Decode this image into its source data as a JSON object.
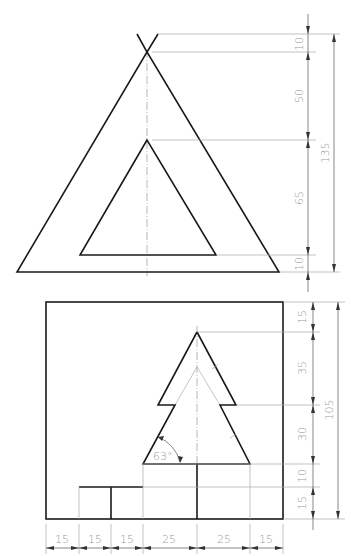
{
  "drawing": {
    "type": "technical-drawing",
    "views": [
      {
        "name": "top-view",
        "description": "Outer triangle with inner triangular cutout, apex lines crossing",
        "dimensions_vertical": [
          {
            "label": "10"
          },
          {
            "label": "50"
          },
          {
            "label": "65"
          },
          {
            "label": "10"
          },
          {
            "label": "135"
          }
        ]
      },
      {
        "name": "bottom-view",
        "description": "Square frame with fir-tree shape and stepped base",
        "dimensions_vertical": [
          {
            "label": "15"
          },
          {
            "label": "35"
          },
          {
            "label": "30"
          },
          {
            "label": "10"
          },
          {
            "label": "15"
          },
          {
            "label": "105"
          }
        ],
        "dimensions_horizontal": [
          {
            "label": "15"
          },
          {
            "label": "15"
          },
          {
            "label": "15"
          },
          {
            "label": "25"
          },
          {
            "label": "25"
          },
          {
            "label": "15"
          }
        ],
        "angle": {
          "label": "63°"
        }
      }
    ]
  }
}
